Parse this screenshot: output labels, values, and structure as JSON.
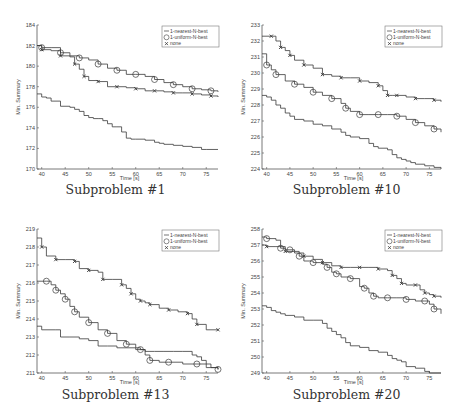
{
  "figure": {
    "colors": {
      "line": "#3a3a3a",
      "axis": "#555555",
      "text": "#444444"
    },
    "legend_entries": [
      "1-nearest-N-best",
      "1-uniform-N-best",
      "none"
    ],
    "xlabel": "Time [s]",
    "ylabel": "Min. Summary"
  },
  "chart_data": [
    {
      "type": "line",
      "title": "Subproblem #1",
      "xlabel": "Time [s]",
      "ylabel": "Min. Summary",
      "xlim": [
        39,
        77.5
      ],
      "ylim": [
        170,
        184
      ],
      "xticks": [
        40,
        45,
        50,
        55,
        60,
        65,
        70,
        75
      ],
      "yticks": [
        170,
        172,
        174,
        176,
        178,
        180,
        182,
        184
      ],
      "legend_position": "upper right",
      "grid": false,
      "series": [
        {
          "name": "1-nearest-N-best",
          "marker": "none",
          "x": [
            39,
            40,
            41,
            42,
            44,
            46,
            47,
            48,
            49,
            50,
            51,
            52,
            53,
            54,
            55,
            56,
            57,
            58,
            59,
            60,
            62,
            64,
            65,
            66,
            68,
            70,
            72,
            74,
            75,
            77.5
          ],
          "y": [
            177.3,
            177.0,
            176.9,
            176.6,
            176.1,
            176.0,
            175.8,
            175.6,
            175.2,
            175.0,
            174.9,
            174.9,
            174.7,
            174.4,
            174.1,
            174.1,
            173.6,
            173.0,
            172.9,
            172.9,
            172.8,
            172.6,
            172.5,
            172.4,
            172.3,
            172.2,
            172.1,
            171.9,
            171.9,
            171.9
          ]
        },
        {
          "name": "1-uniform-N-best",
          "marker": "circle",
          "x": [
            39,
            40,
            42,
            44,
            46,
            48,
            50,
            52,
            54,
            56,
            58,
            60,
            62,
            64,
            66,
            68,
            70,
            72,
            74,
            76,
            77.5
          ],
          "y": [
            182.0,
            181.8,
            181.8,
            181.3,
            181.0,
            180.8,
            180.6,
            180.2,
            179.8,
            179.6,
            179.2,
            179.2,
            179.0,
            178.7,
            178.4,
            178.2,
            178.0,
            177.8,
            177.7,
            177.6,
            177.5
          ]
        },
        {
          "name": "none",
          "marker": "x",
          "x": [
            39,
            40,
            42,
            44,
            46,
            47,
            48,
            49,
            50,
            52,
            54,
            56,
            58,
            60,
            62,
            64,
            66,
            68,
            70,
            72,
            74,
            76,
            77.5
          ],
          "y": [
            182.0,
            181.6,
            181.5,
            181.0,
            180.9,
            180.2,
            179.7,
            179.0,
            178.6,
            178.5,
            178.0,
            178.0,
            177.9,
            177.8,
            177.6,
            177.6,
            177.5,
            177.4,
            177.4,
            177.3,
            177.2,
            177.1,
            177.0
          ]
        }
      ]
    },
    {
      "type": "line",
      "title": "Subproblem #10",
      "xlabel": "Time [s]",
      "ylabel": "Min. Summary",
      "xlim": [
        39,
        77.5
      ],
      "ylim": [
        224,
        233
      ],
      "xticks": [
        40,
        45,
        50,
        55,
        60,
        65,
        70,
        75
      ],
      "yticks": [
        224,
        225,
        226,
        227,
        228,
        229,
        230,
        231,
        232,
        233
      ],
      "legend_position": "upper right",
      "grid": false,
      "series": [
        {
          "name": "1-nearest-N-best",
          "marker": "none",
          "x": [
            39,
            40,
            41,
            42,
            43,
            44,
            45,
            46,
            48,
            50,
            52,
            54,
            56,
            57,
            58,
            60,
            62,
            63,
            64,
            66,
            67,
            68,
            69,
            70,
            71,
            72,
            73,
            74,
            76,
            77.5
          ],
          "y": [
            228.6,
            228.5,
            228.3,
            228.0,
            227.8,
            227.5,
            227.3,
            227.1,
            227.0,
            226.8,
            226.7,
            226.5,
            226.3,
            226.1,
            226.0,
            225.9,
            225.6,
            225.4,
            225.3,
            225.2,
            224.9,
            224.7,
            224.6,
            224.5,
            224.4,
            224.3,
            224.3,
            224.2,
            224.1,
            224.0
          ]
        },
        {
          "name": "1-uniform-N-best",
          "marker": "circle",
          "x": [
            39,
            40,
            41,
            42,
            44,
            46,
            48,
            50,
            52,
            54,
            56,
            57,
            58,
            60,
            62,
            64,
            66,
            68,
            70,
            72,
            74,
            76,
            77.5
          ],
          "y": [
            231.2,
            230.5,
            230.2,
            229.9,
            229.5,
            229.3,
            229.1,
            228.8,
            228.6,
            228.4,
            228.1,
            227.8,
            227.6,
            227.4,
            227.4,
            227.4,
            227.4,
            227.3,
            227.1,
            226.9,
            226.7,
            226.5,
            226.3
          ]
        },
        {
          "name": "1-uniform-N-best-none",
          "marker": "x",
          "x": [
            39,
            41,
            42,
            43,
            44,
            45,
            46,
            48,
            50,
            52,
            54,
            56,
            58,
            60,
            62,
            64,
            65,
            66,
            67,
            68,
            70,
            72,
            74,
            76,
            77.5
          ],
          "y": [
            232.3,
            232.3,
            232.0,
            231.6,
            231.4,
            231.1,
            230.8,
            230.5,
            230.3,
            229.9,
            229.8,
            229.7,
            229.7,
            229.5,
            229.4,
            229.2,
            228.9,
            228.6,
            228.6,
            228.6,
            228.5,
            228.4,
            228.4,
            228.3,
            228.2
          ]
        }
      ]
    },
    {
      "type": "line",
      "title": "Subproblem #13",
      "xlabel": "Time [s]",
      "ylabel": "Min. Summary",
      "xlim": [
        39,
        77.5
      ],
      "ylim": [
        211,
        219
      ],
      "xticks": [
        40,
        45,
        50,
        55,
        60,
        65,
        70,
        75
      ],
      "yticks": [
        211,
        212,
        213,
        214,
        215,
        216,
        217,
        218,
        219
      ],
      "legend_position": "upper right",
      "grid": false,
      "series": [
        {
          "name": "1-nearest-N-best",
          "marker": "none",
          "x": [
            39,
            40,
            43,
            44,
            46,
            48,
            50,
            52,
            54,
            56,
            58,
            60,
            62,
            64,
            66,
            68,
            70,
            72,
            73,
            74,
            75,
            76,
            77.5
          ],
          "y": [
            213.6,
            213.4,
            213.4,
            213.0,
            213.0,
            212.9,
            212.8,
            212.5,
            212.5,
            212.4,
            212.4,
            212.3,
            212.2,
            212.2,
            212.2,
            212.2,
            212.2,
            212.0,
            211.9,
            211.7,
            211.5,
            211.3,
            211.2
          ]
        },
        {
          "name": "1-uniform-N-best",
          "marker": "circle",
          "x": [
            39,
            41,
            42,
            43,
            44,
            45,
            46,
            47,
            48,
            50,
            52,
            54,
            56,
            58,
            60,
            61,
            62,
            63,
            65,
            67,
            70,
            73,
            75,
            77.5
          ],
          "y": [
            216.1,
            216.1,
            215.9,
            215.6,
            215.4,
            215.1,
            214.7,
            214.4,
            214.1,
            213.8,
            213.4,
            213.2,
            212.8,
            212.6,
            212.4,
            212.3,
            212.0,
            211.7,
            211.6,
            211.6,
            211.5,
            211.5,
            211.3,
            211.2
          ]
        },
        {
          "name": "none",
          "marker": "x",
          "x": [
            39,
            40,
            41,
            43,
            45,
            47,
            48,
            50,
            52,
            53,
            55,
            57,
            58,
            59,
            60,
            61,
            62,
            63,
            65,
            67,
            69,
            71,
            72,
            73,
            75,
            77.5
          ],
          "y": [
            218.5,
            218.0,
            217.5,
            217.3,
            217.3,
            217.2,
            216.8,
            216.7,
            216.6,
            216.2,
            216.2,
            215.9,
            215.7,
            215.4,
            215.1,
            215.0,
            214.9,
            214.8,
            214.6,
            214.5,
            214.4,
            214.3,
            214.0,
            213.7,
            213.4,
            213.4
          ]
        }
      ]
    },
    {
      "type": "line",
      "title": "Subproblem #20",
      "xlabel": "Time [s]",
      "ylabel": "Min. Summary",
      "xlim": [
        39,
        77.5
      ],
      "ylim": [
        249,
        258
      ],
      "xticks": [
        40,
        45,
        50,
        55,
        60,
        65,
        70,
        75
      ],
      "yticks": [
        249,
        250,
        251,
        252,
        253,
        254,
        255,
        256,
        257,
        258
      ],
      "legend_position": "upper right",
      "grid": false,
      "series": [
        {
          "name": "1-nearest-N-best",
          "marker": "none",
          "x": [
            39,
            40,
            41,
            42,
            43,
            44,
            46,
            48,
            50,
            52,
            53,
            54,
            55,
            56,
            57,
            58,
            60,
            62,
            64,
            66,
            67,
            68,
            69,
            70,
            72,
            74,
            75,
            77.5
          ],
          "y": [
            253.2,
            253.1,
            252.9,
            252.8,
            252.7,
            252.6,
            252.5,
            252.3,
            252.3,
            252.1,
            251.8,
            251.6,
            251.4,
            251.2,
            250.9,
            250.7,
            250.6,
            250.4,
            250.3,
            250.1,
            249.9,
            249.8,
            249.7,
            249.4,
            249.3,
            249.1,
            249.0,
            249.0
          ]
        },
        {
          "name": "1-uniform-N-best",
          "marker": "circle",
          "x": [
            39,
            40,
            42,
            43,
            44,
            45,
            46,
            47,
            48,
            50,
            52,
            53,
            54,
            55,
            56,
            58,
            60,
            61,
            62,
            63,
            64,
            66,
            68,
            70,
            72,
            74,
            75,
            76,
            77.5
          ],
          "y": [
            257.5,
            257.4,
            257.3,
            256.8,
            256.7,
            256.7,
            256.6,
            256.3,
            256.0,
            255.9,
            255.8,
            255.6,
            255.3,
            255.2,
            255.0,
            254.9,
            254.4,
            254.3,
            254.0,
            253.8,
            253.7,
            253.7,
            253.7,
            253.6,
            253.5,
            253.5,
            253.3,
            253.0,
            252.7
          ]
        },
        {
          "name": "none",
          "marker": "x",
          "x": [
            39,
            40,
            42,
            44,
            46,
            48,
            50,
            52,
            54,
            56,
            58,
            60,
            62,
            64,
            66,
            67,
            68,
            69,
            70,
            72,
            73,
            74,
            75,
            76,
            77.5
          ],
          "y": [
            257.0,
            256.9,
            256.9,
            256.6,
            256.5,
            256.3,
            256.1,
            255.9,
            255.7,
            255.6,
            255.6,
            255.6,
            255.6,
            255.5,
            255.4,
            255.1,
            254.9,
            254.6,
            254.5,
            254.5,
            254.2,
            254.0,
            253.9,
            253.8,
            253.7
          ]
        }
      ]
    }
  ]
}
